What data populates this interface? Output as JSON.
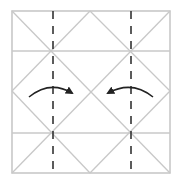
{
  "diagram": {
    "title": "",
    "kind": "origami-fold-diagram",
    "colors": {
      "background": "#ffffff",
      "crease": "#c8c8c8",
      "valley_fold": "#333333",
      "arrow": "#222222"
    },
    "square": {
      "x1": 12,
      "y1": 11,
      "x2": 170,
      "y2": 173
    },
    "crease_lines": [
      {
        "name": "horizontal-crease-upper",
        "x1": 12,
        "y1": 51,
        "x2": 170,
        "y2": 51
      },
      {
        "name": "horizontal-crease-lower",
        "x1": 12,
        "y1": 133,
        "x2": 170,
        "y2": 133
      },
      {
        "name": "diagonal-crease-main",
        "x1": 12,
        "y1": 11,
        "x2": 170,
        "y2": 173
      },
      {
        "name": "diagonal-crease-anti",
        "x1": 170,
        "y1": 11,
        "x2": 12,
        "y2": 173
      },
      {
        "name": "diamond-edge-top-left",
        "x1": 90,
        "y1": 11,
        "x2": 12,
        "y2": 91
      },
      {
        "name": "diamond-edge-top-right",
        "x1": 90,
        "y1": 11,
        "x2": 170,
        "y2": 91
      },
      {
        "name": "diamond-edge-bottom-left",
        "x1": 12,
        "y1": 91,
        "x2": 90,
        "y2": 173
      },
      {
        "name": "diamond-edge-bottom-right",
        "x1": 170,
        "y1": 91,
        "x2": 90,
        "y2": 173
      }
    ],
    "fold_lines": [
      {
        "name": "valley-fold-left",
        "x1": 53,
        "y1": 11,
        "x2": 53,
        "y2": 173
      },
      {
        "name": "valley-fold-right",
        "x1": 131,
        "y1": 11,
        "x2": 131,
        "y2": 173
      }
    ],
    "arrows": [
      {
        "name": "fold-arrow-left-to-right",
        "path": "M29,97 Q50,80 72,93",
        "direction": "right"
      },
      {
        "name": "fold-arrow-right-to-left",
        "path": "M153,97 Q132,80 108,93",
        "direction": "left"
      }
    ],
    "dash_pattern": "8 7"
  }
}
